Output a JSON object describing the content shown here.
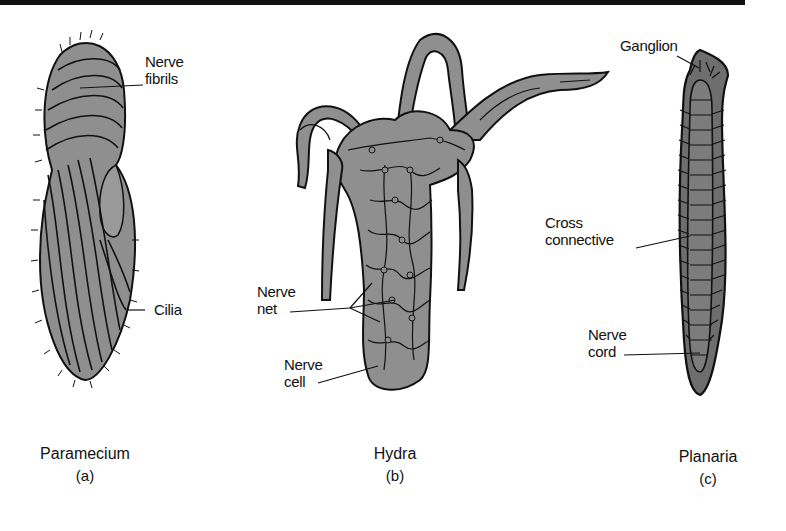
{
  "figure": {
    "panels": [
      {
        "id": "a",
        "organism": "Paramecium",
        "letter": "(a)",
        "labels": {
          "nerve_fibrils_1": "Nerve",
          "nerve_fibrils_2": "fibrils",
          "cilia": "Cilia"
        }
      },
      {
        "id": "b",
        "organism": "Hydra",
        "letter": "(b)",
        "labels": {
          "nerve_net_1": "Nerve",
          "nerve_net_2": "net",
          "nerve_cell_1": "Nerve",
          "nerve_cell_2": "cell"
        }
      },
      {
        "id": "c",
        "organism": "Planaria",
        "letter": "(c)",
        "labels": {
          "ganglion": "Ganglion",
          "cross_connective_1": "Cross",
          "cross_connective_2": "connective",
          "nerve_cord_1": "Nerve",
          "nerve_cord_2": "cord"
        }
      }
    ],
    "colors": {
      "body_fill": "#8f8f8f",
      "planaria_fill": "#6e6e6e",
      "line": "#111111"
    }
  }
}
